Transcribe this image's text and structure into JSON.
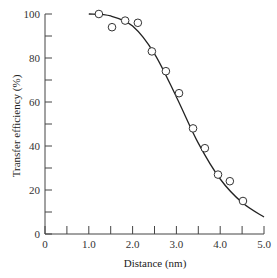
{
  "chart_data": {
    "type": "scatter",
    "title": "",
    "xlabel": "Distance (nm)",
    "ylabel": "Transfer efficiency (%)",
    "xlim": [
      0,
      5.0
    ],
    "ylim": [
      0,
      100
    ],
    "x_ticks": [
      "0",
      "1.0",
      "2.0",
      "3.0",
      "4.0",
      "5.0"
    ],
    "x_tick_values": [
      0,
      1.0,
      2.0,
      3.0,
      4.0,
      5.0
    ],
    "x_minor_tick_values": [
      0.5,
      1.5,
      2.5,
      3.5,
      4.5
    ],
    "y_ticks": [
      "0",
      "20",
      "40",
      "60",
      "80",
      "100"
    ],
    "y_tick_values": [
      0,
      20,
      40,
      60,
      80,
      100
    ],
    "y_minor_tick_values": [
      10,
      30,
      50,
      70,
      90
    ],
    "grid": false,
    "legend": null,
    "series": [
      {
        "name": "Measured",
        "style": "open-circle markers",
        "x": [
          1.23,
          1.53,
          1.83,
          2.12,
          2.44,
          2.76,
          3.06,
          3.38,
          3.65,
          3.95,
          4.22,
          4.52
        ],
        "y": [
          100,
          94,
          97,
          96,
          83,
          74,
          64,
          48,
          39,
          27,
          24,
          15
        ]
      },
      {
        "name": "Theoretical fit",
        "style": "solid line",
        "x": [
          1.0,
          1.5,
          2.0,
          2.5,
          3.0,
          3.5,
          4.0,
          4.5,
          5.0
        ],
        "y": [
          100,
          99.1,
          94.5,
          81.9,
          62.3,
          41.3,
          25.0,
          14.3,
          7.7
        ]
      }
    ]
  }
}
